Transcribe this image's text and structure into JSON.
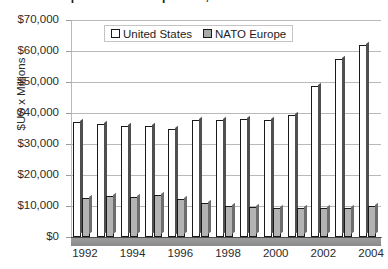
{
  "title_partial": "Defense Expenditures Comparison, 1992-2004",
  "legend": {
    "position": "top-center-inside",
    "items": [
      {
        "label": "United States",
        "swatch": "hollow-white-square",
        "color": "#ffffff"
      },
      {
        "label": "NATO Europe",
        "swatch": "filled-gray-square",
        "color": "#b3b3b3"
      }
    ]
  },
  "axes": {
    "ylabel": "$US x Millions",
    "xlabel": "",
    "ytick_labels": [
      "$70,000",
      "$60,000",
      "$50,000",
      "$40,000",
      "$30,000",
      "$20,000",
      "$10,000",
      "$0"
    ],
    "xtick_labels": [
      "1992",
      "1994",
      "1996",
      "1998",
      "2000",
      "2002",
      "2004"
    ]
  },
  "chart_data": {
    "type": "bar",
    "title": "Defense Expenditures Comparison, 1992-2004",
    "xlabel": "",
    "ylabel": "$US x Millions",
    "ylim": [
      0,
      70000
    ],
    "ytick_step": 10000,
    "grid": true,
    "legend_position": "top-center",
    "categories": [
      "1992",
      "1993",
      "1994",
      "1995",
      "1996",
      "1997",
      "1998",
      "1999",
      "2000",
      "2001",
      "2002",
      "2003",
      "2004"
    ],
    "xtick_labels_shown": [
      "1992",
      "1994",
      "1996",
      "1998",
      "2000",
      "2002",
      "2004"
    ],
    "series": [
      {
        "name": "United States",
        "color": "#ffffff",
        "values": [
          37000,
          36500,
          35800,
          35800,
          35000,
          37600,
          37700,
          38200,
          37700,
          39300,
          48600,
          57300,
          62000
        ]
      },
      {
        "name": "NATO Europe",
        "color": "#b3b3b3",
        "values": [
          12700,
          13200,
          12900,
          13700,
          12400,
          10900,
          10100,
          9600,
          9500,
          9500,
          9400,
          9500,
          10000
        ]
      }
    ]
  }
}
